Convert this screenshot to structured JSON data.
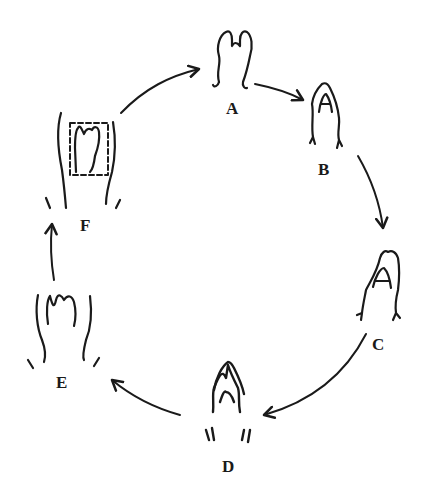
{
  "diagram": {
    "type": "cycle",
    "stages": [
      {
        "id": "A",
        "label": "A"
      },
      {
        "id": "B",
        "label": "B"
      },
      {
        "id": "C",
        "label": "C"
      },
      {
        "id": "D",
        "label": "D"
      },
      {
        "id": "E",
        "label": "E"
      },
      {
        "id": "F",
        "label": "F"
      }
    ],
    "arrows": [
      {
        "from": "F",
        "to": "A"
      },
      {
        "from": "A",
        "to": "B"
      },
      {
        "from": "B",
        "to": "C"
      },
      {
        "from": "C",
        "to": "D"
      },
      {
        "from": "D",
        "to": "E"
      },
      {
        "from": "E",
        "to": "F"
      }
    ],
    "ink_color": "#1a1a1a",
    "background": "#ffffff"
  }
}
